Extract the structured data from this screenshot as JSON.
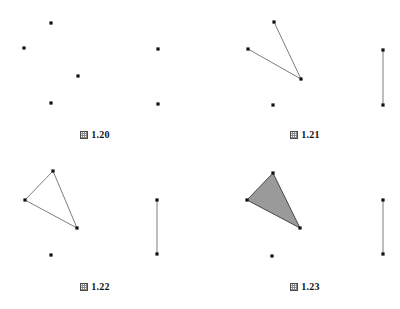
{
  "sheet": {
    "width": 400,
    "height": 309,
    "background": "#ffffff",
    "point_color": "#111111",
    "line_color": "#6e6e6e",
    "fill_color": "#9a9a9a",
    "point_radius": 1.6,
    "line_width": 0.9
  },
  "panels": [
    {
      "id": "figure-1-20",
      "caption_marker": "図",
      "caption_number": "1.20",
      "caption_text": "図 1.20",
      "origin": {
        "x": 0,
        "y": 0
      },
      "points": [
        {
          "name": "point-apex",
          "x": 51,
          "y": 23
        },
        {
          "name": "point-left",
          "x": 24,
          "y": 48
        },
        {
          "name": "point-right",
          "x": 78,
          "y": 76
        },
        {
          "name": "point-lower",
          "x": 51,
          "y": 103
        },
        {
          "name": "point-segment-top",
          "x": 158,
          "y": 49
        },
        {
          "name": "point-segment-bottom",
          "x": 158,
          "y": 104
        }
      ],
      "lines": [],
      "polygons": [],
      "caption_position": {
        "x": 0,
        "y": 130,
        "width": 190
      }
    },
    {
      "id": "figure-1-21",
      "caption_marker": "図",
      "caption_number": "1.21",
      "caption_text": "図 1.21",
      "origin": {
        "x": 0,
        "y": 0
      },
      "points": [
        {
          "name": "point-apex",
          "x": 274,
          "y": 22
        },
        {
          "name": "point-left",
          "x": 248,
          "y": 49
        },
        {
          "name": "point-vertex",
          "x": 301,
          "y": 79
        },
        {
          "name": "point-lower",
          "x": 273,
          "y": 105
        },
        {
          "name": "point-segment-top",
          "x": 383,
          "y": 50
        },
        {
          "name": "point-segment-bottom",
          "x": 383,
          "y": 105
        }
      ],
      "lines": [
        {
          "name": "edge-apex-to-vertex",
          "x1": 274,
          "y1": 22,
          "x2": 301,
          "y2": 79
        },
        {
          "name": "edge-left-to-vertex",
          "x1": 248,
          "y1": 49,
          "x2": 301,
          "y2": 79
        },
        {
          "name": "reference-segment",
          "x1": 383,
          "y1": 50,
          "x2": 383,
          "y2": 105
        }
      ],
      "polygons": [],
      "caption_position": {
        "x": 210,
        "y": 130,
        "width": 190
      }
    },
    {
      "id": "figure-1-22",
      "caption_marker": "図",
      "caption_number": "1.22",
      "caption_text": "図 1.22",
      "origin": {
        "x": 0,
        "y": 0
      },
      "points": [
        {
          "name": "point-apex",
          "x": 53,
          "y": 171
        },
        {
          "name": "point-left",
          "x": 25,
          "y": 200
        },
        {
          "name": "point-vertex",
          "x": 77,
          "y": 228
        },
        {
          "name": "point-lower",
          "x": 51,
          "y": 255
        },
        {
          "name": "point-segment-top",
          "x": 157,
          "y": 200
        },
        {
          "name": "point-segment-bottom",
          "x": 157,
          "y": 254
        }
      ],
      "lines": [
        {
          "name": "edge-apex-to-vertex",
          "x1": 53,
          "y1": 171,
          "x2": 77,
          "y2": 228
        },
        {
          "name": "edge-left-to-vertex",
          "x1": 25,
          "y1": 200,
          "x2": 77,
          "y2": 228
        },
        {
          "name": "edge-apex-to-left",
          "x1": 53,
          "y1": 171,
          "x2": 25,
          "y2": 200
        },
        {
          "name": "reference-segment",
          "x1": 157,
          "y1": 200,
          "x2": 157,
          "y2": 254
        }
      ],
      "polygons": [],
      "caption_position": {
        "x": 0,
        "y": 280,
        "width": 190
      }
    },
    {
      "id": "figure-1-23",
      "caption_marker": "図",
      "caption_number": "1.23",
      "caption_text": "図 1.23",
      "origin": {
        "x": 0,
        "y": 0
      },
      "points": [
        {
          "name": "point-apex",
          "x": 273,
          "y": 173
        },
        {
          "name": "point-left",
          "x": 247,
          "y": 200
        },
        {
          "name": "point-vertex",
          "x": 300,
          "y": 228
        },
        {
          "name": "point-lower",
          "x": 272,
          "y": 256
        },
        {
          "name": "point-segment-top",
          "x": 383,
          "y": 200
        },
        {
          "name": "point-segment-bottom",
          "x": 383,
          "y": 254
        }
      ],
      "lines": [
        {
          "name": "reference-segment",
          "x1": 383,
          "y1": 200,
          "x2": 383,
          "y2": 254
        }
      ],
      "polygons": [
        {
          "name": "filled-triangle",
          "points": "273,173 247,200 300,228",
          "fill": "#9a9a9a",
          "stroke": "#3a3a3a"
        }
      ],
      "caption_position": {
        "x": 210,
        "y": 280,
        "width": 190
      }
    }
  ]
}
